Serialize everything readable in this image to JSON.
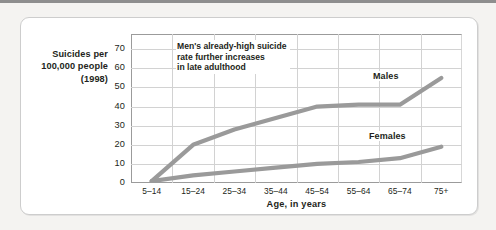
{
  "figure": {
    "y_axis_title": "Suicides per\n100,000 people\n(1998)",
    "x_axis_title": "Age, in years",
    "annotation": "Men's already-high suicide\nrate further increases\nin late adulthood",
    "series_labels": {
      "males": "Males",
      "females": "Females"
    },
    "line_color": "#9a9a9a",
    "grid_color": "#d2d2d2",
    "axis_color": "#9b9b9b",
    "text_color": "#231f20",
    "card_background": "#ffffff",
    "page_background": "#f4f3f1"
  },
  "chart_data": {
    "type": "line",
    "title": "",
    "xlabel": "Age, in years",
    "ylabel": "Suicides per 100,000 people (1998)",
    "categories": [
      "5–14",
      "15–24",
      "25–34",
      "35–44",
      "45–54",
      "55–64",
      "65–74",
      "75+"
    ],
    "ylim": [
      0,
      78
    ],
    "yticks": [
      0,
      10,
      20,
      30,
      40,
      50,
      60,
      70
    ],
    "ytick_labels": [
      "0",
      "10",
      "20",
      "30",
      "40",
      "50",
      "60",
      "70"
    ],
    "grid": true,
    "legend": "inline-labels",
    "annotations": [
      {
        "text": "Men's already-high suicide rate further increases in late adulthood",
        "target": "males"
      }
    ],
    "series": [
      {
        "name": "Males",
        "color": "#9a9a9a",
        "values": [
          1,
          20,
          28,
          34,
          40,
          41,
          41,
          55
        ]
      },
      {
        "name": "Females",
        "color": "#9a9a9a",
        "values": [
          1,
          4,
          6,
          8,
          10,
          11,
          13,
          19
        ]
      }
    ]
  }
}
